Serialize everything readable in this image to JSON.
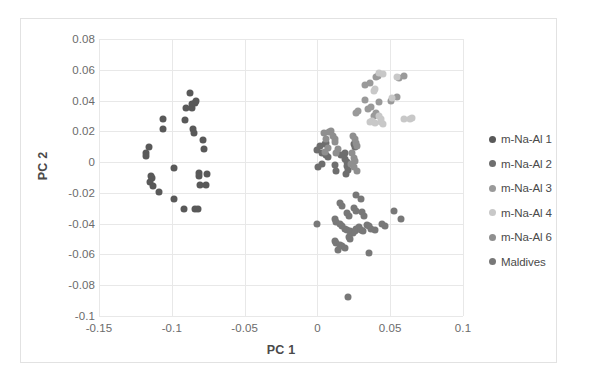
{
  "figure": {
    "background": "#ffffff",
    "frame_color": "#e2e2e2",
    "grid_color": "#e8e8e8"
  },
  "chart_data": {
    "type": "scatter",
    "title": "",
    "xlabel": "PC 1",
    "ylabel": "PC 2",
    "xlim": [
      -0.15,
      0.1
    ],
    "ylim": [
      -0.1,
      0.08
    ],
    "xticks": [
      "-0.15",
      "-0.1",
      "-0.05",
      "0",
      "0.05",
      "0.1"
    ],
    "xtick_values": [
      -0.15,
      -0.1,
      -0.05,
      0,
      0.05,
      0.1
    ],
    "yticks": [
      "0.08",
      "0.06",
      "0.04",
      "0.02",
      "0",
      "-0.02",
      "-0.04",
      "-0.06",
      "-0.08",
      "-0.1"
    ],
    "ytick_values": [
      0.08,
      0.06,
      0.04,
      0.02,
      0,
      -0.02,
      -0.04,
      -0.06,
      -0.08,
      -0.1
    ],
    "grid": true,
    "legend_position": "right",
    "series": [
      {
        "name": "m-Na-Al 1",
        "color": "#595959",
        "points": [
          [
            -0.1155,
            0.0098
          ],
          [
            -0.118,
            0.0058
          ],
          [
            -0.1175,
            0.0042
          ],
          [
            -0.114,
            -0.0088
          ],
          [
            -0.1135,
            -0.0105
          ],
          [
            -0.115,
            -0.0128
          ],
          [
            -0.113,
            -0.0152
          ],
          [
            -0.1085,
            -0.0192
          ],
          [
            -0.1062,
            0.0278
          ],
          [
            -0.106,
            0.0212
          ],
          [
            -0.0985,
            -0.004
          ],
          [
            -0.0908,
            0.0272
          ],
          [
            -0.0905,
            0.0352
          ],
          [
            -0.0878,
            0.0448
          ],
          [
            -0.0862,
            0.0378
          ],
          [
            -0.0858,
            0.0352
          ],
          [
            -0.0852,
            0.0212
          ],
          [
            -0.085,
            0.0188
          ],
          [
            -0.0838,
            0.0382
          ],
          [
            -0.0835,
            0.04
          ],
          [
            -0.0815,
            -0.0072
          ],
          [
            -0.0812,
            -0.009
          ],
          [
            -0.0808,
            -0.0148
          ],
          [
            -0.0785,
            0.0142
          ],
          [
            -0.078,
            0.0088
          ],
          [
            -0.0768,
            -0.0148
          ],
          [
            -0.076,
            -0.008
          ],
          [
            -0.0985,
            -0.0238
          ],
          [
            -0.0918,
            -0.0302
          ],
          [
            -0.0838,
            -0.0305
          ],
          [
            -0.0822,
            -0.0302
          ]
        ]
      },
      {
        "name": "m-Na-Al 2",
        "color": "#6e6e6e",
        "points": [
          [
            0.002,
            0.0102
          ],
          [
            0.0052,
            0.0118
          ],
          [
            0.0058,
            0.0122
          ],
          [
            0.0,
            0.0078
          ],
          [
            0.003,
            0.0062
          ],
          [
            0.0032,
            -0.0012
          ],
          [
            0.0002,
            -0.0032
          ],
          [
            0.0058,
            0.0048
          ],
          [
            0.0075,
            0.0032
          ],
          [
            0.019,
            0.0058
          ],
          [
            0.0192,
            0.002
          ],
          [
            0.02,
            0.0002
          ],
          [
            0.016,
            0.0048
          ],
          [
            0.02,
            -0.0028
          ],
          [
            0.021,
            -0.005
          ],
          [
            0.0198,
            -0.0078
          ],
          [
            0.0252,
            0.012
          ],
          [
            0.0258,
            0.0098
          ],
          [
            0.0122,
            -0.0018
          ],
          [
            0.013,
            -0.006
          ]
        ]
      },
      {
        "name": "m-Na-Al 3",
        "color": "#9a9a9a",
        "points": [
          [
            0.0325,
            0.05
          ],
          [
            0.0362,
            0.0512
          ],
          [
            0.04,
            0.0552
          ],
          [
            0.0418,
            0.0558
          ],
          [
            0.0562,
            0.0548
          ],
          [
            0.0592,
            0.0562
          ],
          [
            0.0325,
            0.0402
          ],
          [
            0.042,
            0.039
          ],
          [
            0.0508,
            0.0398
          ],
          [
            0.0545,
            0.0422
          ],
          [
            0.0262,
            0.0322
          ],
          [
            0.0282,
            0.033
          ],
          [
            0.0388,
            0.0302
          ],
          [
            0.0402,
            0.0318
          ],
          [
            0.0345,
            0.0342
          ],
          [
            0.0368,
            0.0358
          ]
        ]
      },
      {
        "name": "m-Na-Al 4",
        "color": "#c8c8c8",
        "points": [
          [
            0.042,
            0.058
          ],
          [
            0.0448,
            0.0572
          ],
          [
            0.0545,
            0.0552
          ],
          [
            0.051,
            0.0418
          ],
          [
            0.0392,
            0.0462
          ],
          [
            0.0398,
            0.0478
          ],
          [
            0.042,
            0.03
          ],
          [
            0.0435,
            0.0282
          ],
          [
            0.044,
            0.0262
          ],
          [
            0.045,
            0.025
          ],
          [
            0.0598,
            0.0282
          ],
          [
            0.0638,
            0.028
          ],
          [
            0.0652,
            0.0285
          ],
          [
            0.0362,
            0.026
          ],
          [
            0.0375,
            0.0268
          ],
          [
            0.0398,
            0.0252
          ]
        ]
      },
      {
        "name": "m-Na-Al 6",
        "color": "#8f8f8f",
        "points": [
          [
            0.0042,
            0.0192
          ],
          [
            0.008,
            0.0198
          ],
          [
            0.009,
            0.02
          ],
          [
            0.0062,
            0.0148
          ],
          [
            0.0105,
            0.0168
          ],
          [
            0.0118,
            0.0152
          ],
          [
            0.012,
            0.0132
          ],
          [
            0.0242,
            0.0168
          ],
          [
            0.0255,
            0.0148
          ],
          [
            0.0262,
            0.0125
          ],
          [
            0.0272,
            0.0102
          ],
          [
            0.0072,
            0.009
          ],
          [
            0.0142,
            0.0082
          ],
          [
            0.013,
            0.0062
          ],
          [
            0.0055,
            0.0068
          ],
          [
            0.024,
            0.0058
          ],
          [
            0.0252,
            0.0028
          ],
          [
            0.026,
            0.001
          ],
          [
            0.023,
            -0.001
          ],
          [
            0.027,
            -0.0058
          ],
          [
            0.0248,
            -0.0032
          ]
        ]
      },
      {
        "name": "Maldives",
        "color": "#787878",
        "points": [
          [
            0.0,
            -0.0405
          ],
          [
            0.0118,
            -0.0372
          ],
          [
            0.013,
            -0.0388
          ],
          [
            0.0158,
            -0.0405
          ],
          [
            0.0172,
            -0.0418
          ],
          [
            0.0188,
            -0.0432
          ],
          [
            0.0205,
            -0.0442
          ],
          [
            0.0222,
            -0.0448
          ],
          [
            0.0232,
            -0.046
          ],
          [
            0.0245,
            -0.0458
          ],
          [
            0.026,
            -0.0445
          ],
          [
            0.0268,
            -0.0435
          ],
          [
            0.0285,
            -0.0422
          ],
          [
            0.0298,
            -0.044
          ],
          [
            0.031,
            -0.0448
          ],
          [
            0.0338,
            -0.0408
          ],
          [
            0.0352,
            -0.0418
          ],
          [
            0.037,
            -0.0432
          ],
          [
            0.0398,
            -0.0438
          ],
          [
            0.0442,
            -0.0402
          ],
          [
            0.0462,
            -0.0412
          ],
          [
            0.0305,
            -0.0325
          ],
          [
            0.0318,
            -0.0348
          ],
          [
            0.0248,
            -0.03
          ],
          [
            0.0262,
            -0.0318
          ],
          [
            0.0205,
            -0.0332
          ],
          [
            0.0218,
            -0.0348
          ],
          [
            0.0168,
            -0.0288
          ],
          [
            0.0152,
            -0.0268
          ],
          [
            0.0118,
            -0.0512
          ],
          [
            0.013,
            -0.0528
          ],
          [
            0.0152,
            -0.0538
          ],
          [
            0.0168,
            -0.0548
          ],
          [
            0.014,
            -0.0572
          ],
          [
            0.0188,
            -0.0558
          ],
          [
            0.0218,
            -0.0488
          ],
          [
            0.0222,
            -0.05
          ],
          [
            0.0352,
            -0.0588
          ],
          [
            0.0208,
            -0.0878
          ],
          [
            0.0528,
            -0.0318
          ],
          [
            0.0572,
            -0.0368
          ],
          [
            0.0298,
            -0.0238
          ],
          [
            0.0262,
            -0.0215
          ]
        ]
      }
    ]
  },
  "legend": {
    "entries": [
      {
        "label": "m-Na-Al 1",
        "color": "#595959"
      },
      {
        "label": "m-Na-Al 2",
        "color": "#6e6e6e"
      },
      {
        "label": "m-Na-Al 3",
        "color": "#9a9a9a"
      },
      {
        "label": "m-Na-Al 4",
        "color": "#c8c8c8"
      },
      {
        "label": "m-Na-Al 6",
        "color": "#8f8f8f"
      },
      {
        "label": "Maldives",
        "color": "#787878"
      }
    ]
  }
}
